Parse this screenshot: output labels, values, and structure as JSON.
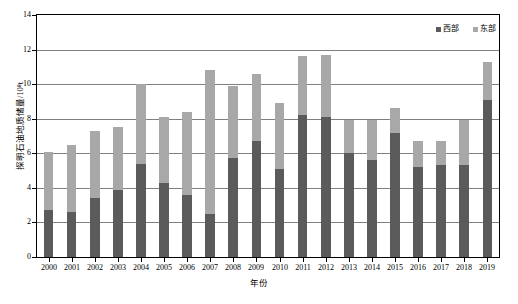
{
  "chart_data": {
    "type": "bar",
    "subtype": "stacked-bar",
    "title": "",
    "xlabel": "年份",
    "ylabel": "探明石油地质储量/10⁸t",
    "ylim": [
      0,
      14
    ],
    "yticks": [
      0,
      2,
      4,
      6,
      8,
      10,
      12,
      14
    ],
    "ytick_labels": [
      "0",
      "2",
      "4",
      "6",
      "8",
      "10",
      "12",
      "14"
    ],
    "grid": true,
    "grid_axis": "y",
    "legend_position": "top-right",
    "categories": [
      "2000",
      "2001",
      "2002",
      "2003",
      "2004",
      "2005",
      "2006",
      "2007",
      "2008",
      "2009",
      "2010",
      "2011",
      "2012",
      "2013",
      "2014",
      "2015",
      "2016",
      "2017",
      "2018",
      "2019"
    ],
    "series": [
      {
        "name": "西部",
        "color": "#5b5b5b",
        "values": [
          2.7,
          2.6,
          3.4,
          3.9,
          5.4,
          4.3,
          3.6,
          2.5,
          5.7,
          6.7,
          5.1,
          8.2,
          8.1,
          6.0,
          5.6,
          7.2,
          5.2,
          5.3,
          5.3,
          9.1
        ]
      },
      {
        "name": "东部",
        "color": "#a8a8a8",
        "values": [
          3.4,
          3.9,
          3.9,
          3.6,
          4.6,
          3.8,
          4.8,
          8.3,
          4.2,
          3.9,
          3.8,
          3.4,
          3.6,
          1.9,
          2.3,
          1.4,
          1.5,
          1.4,
          2.6,
          2.2
        ]
      }
    ],
    "totals": [
      6.1,
      6.5,
      7.3,
      7.5,
      10.0,
      8.1,
      8.4,
      10.8,
      9.9,
      10.6,
      8.9,
      11.6,
      11.7,
      7.9,
      7.9,
      8.6,
      6.7,
      6.7,
      7.9,
      11.3
    ],
    "axis_colors": {
      "frame": "#000000",
      "gridline": "#808080",
      "west_series": "#5b5b5b",
      "east_series": "#a8a8a8"
    }
  },
  "legend": {
    "items": [
      {
        "label": "西部",
        "color": "#5b5b5b"
      },
      {
        "label": "东部",
        "color": "#a8a8a8"
      }
    ]
  },
  "caption": {
    "text": ""
  }
}
